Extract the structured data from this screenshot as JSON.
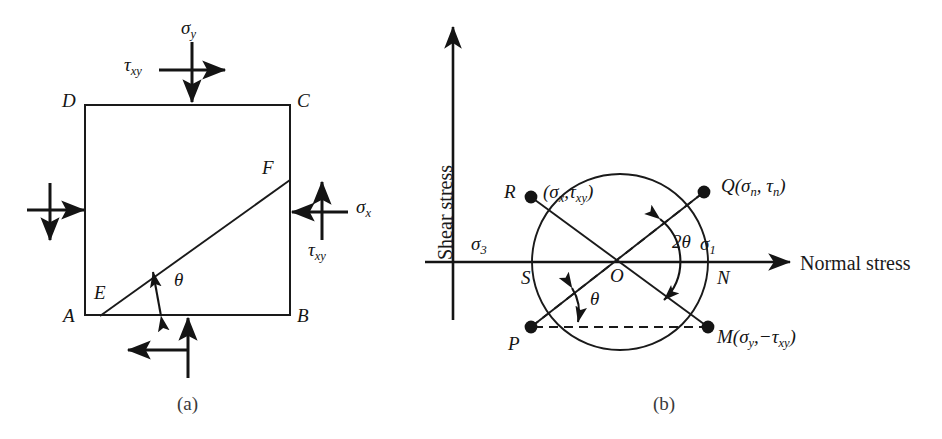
{
  "figure": {
    "caption_a": "(a)",
    "caption_b": "(b)"
  },
  "panel_a": {
    "title": "Stress element with inclined plane EF",
    "corner_labels": {
      "A": "A",
      "B": "B",
      "C": "C",
      "D": "D",
      "E": "E",
      "F": "F"
    },
    "angle_label": "θ",
    "stress_labels": {
      "sigma_y": "σy",
      "sigma_y_base": "σ",
      "sigma_y_sub": "y",
      "sigma_x_base": "σ",
      "sigma_x_sub": "x",
      "tau_top_base": "τ",
      "tau_top_sub": "xy",
      "tau_right_base": "τ",
      "tau_right_sub": "xy"
    }
  },
  "panel_b": {
    "title": "Mohr's circle of stress",
    "axis_x_label": "Normal stress",
    "axis_y_label": "Shear stress",
    "point_labels": {
      "R": "R",
      "Q_base": "Q",
      "Q_args": "(σn, τn)",
      "Q_sigma": "σ",
      "Q_sigma_sub": "n",
      "Q_tau": "τ",
      "Q_tau_sub": "n",
      "R_coords_open": "(",
      "R_sigma": "σ",
      "R_sigma_sub": "x",
      "R_comma": ",",
      "R_tau": "τ",
      "R_tau_sub": "xy",
      "R_coords_close": ")",
      "P": "P",
      "M_base": "M",
      "M_open": "(",
      "M_sigma": "σ",
      "M_sigma_sub": "y",
      "M_comma": ",−",
      "M_tau": "τ",
      "M_tau_sub": "xy",
      "M_close": ")",
      "S": "S",
      "N": "N",
      "O": "O"
    },
    "principal_labels": {
      "sigma_1_base": "σ",
      "sigma_1_sub": "1",
      "sigma_3_base": "σ",
      "sigma_3_sub": "3"
    },
    "angle_labels": {
      "two_theta": "2θ",
      "theta": "θ"
    }
  },
  "colors": {
    "ink": "#141414",
    "line": "#1a1a1a",
    "caption": "#3a3a3a",
    "background": "#ffffff"
  },
  "geometry": {
    "square": {
      "left": 85,
      "top": 105,
      "right": 290,
      "bottom": 315
    },
    "circle": {
      "cx": 620,
      "cy": 262,
      "r": 88
    },
    "points": {
      "R": [
        531,
        197
      ],
      "Q": [
        704,
        192
      ],
      "P": [
        531,
        327
      ],
      "M": [
        708,
        327
      ],
      "O": [
        620,
        262
      ]
    }
  }
}
